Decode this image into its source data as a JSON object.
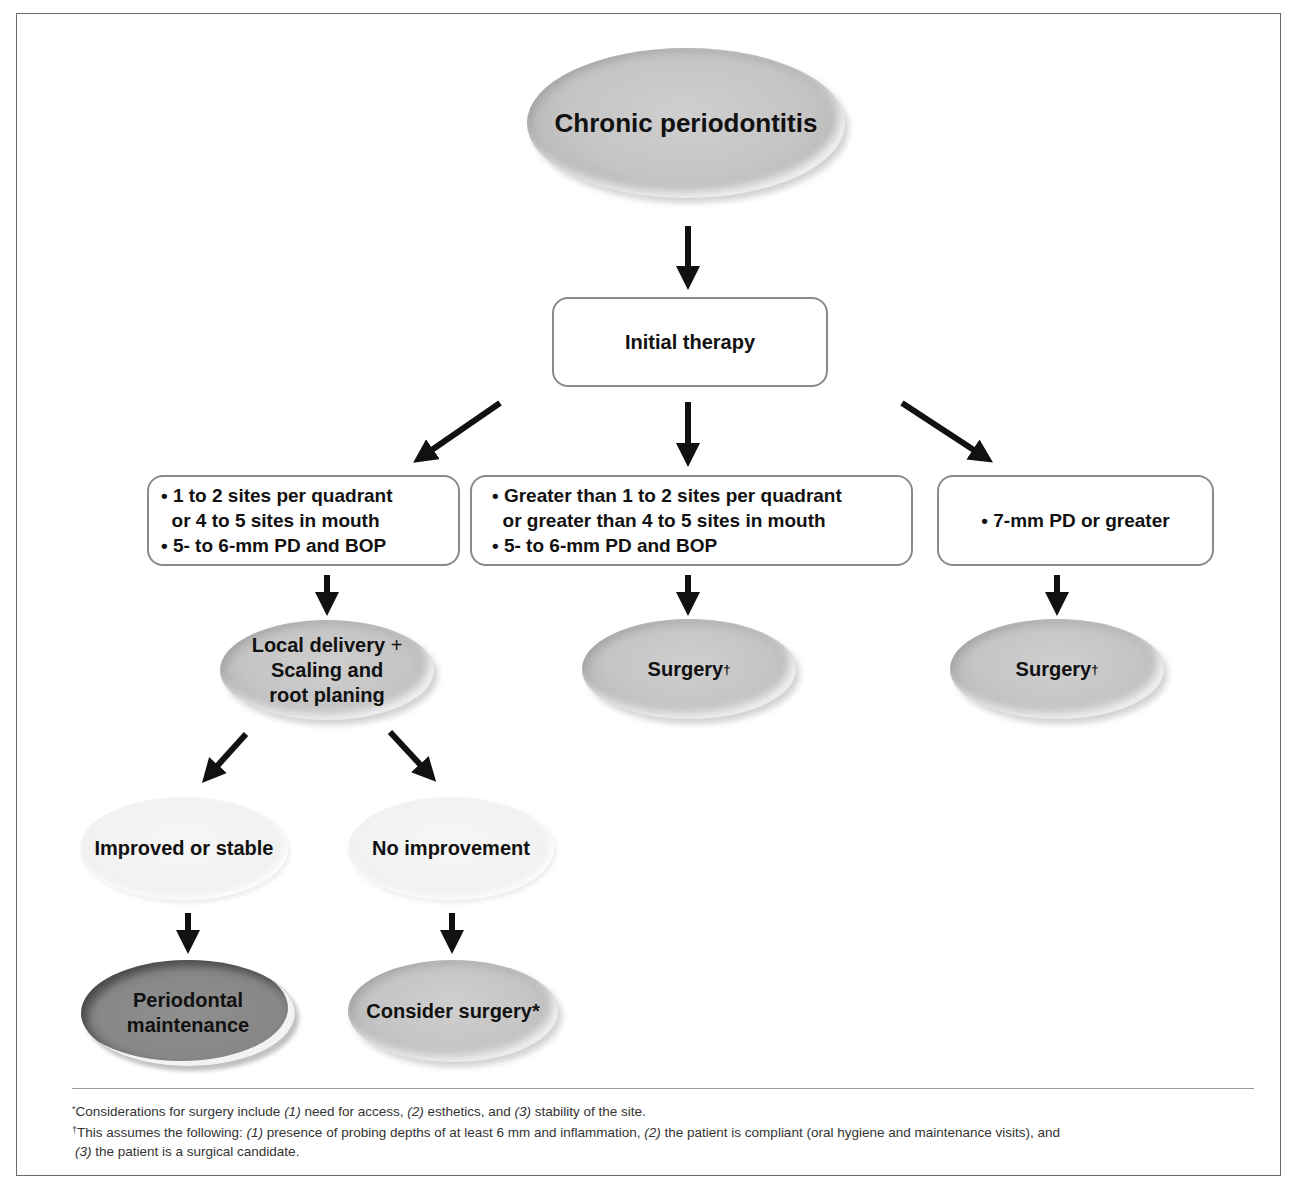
{
  "diagram": {
    "type": "flowchart",
    "title_node": "Chronic periodontitis",
    "nodes": {
      "root": {
        "label": "Chronic periodontitis",
        "shape": "ellipse",
        "fill": "gray"
      },
      "initial_therapy": {
        "label": "Initial therapy",
        "shape": "rounded-box"
      },
      "criteria_left": {
        "shape": "rounded-box",
        "lines": [
          "• 1 to 2 sites per quadrant",
          "  or 4 to 5 sites in mouth",
          "• 5- to 6-mm PD and BOP"
        ]
      },
      "criteria_middle": {
        "shape": "rounded-box",
        "lines": [
          "• Greater than 1 to 2 sites per quadrant",
          "  or greater than 4 to 5 sites in mouth",
          "• 5- to 6-mm PD and BOP"
        ]
      },
      "criteria_right": {
        "shape": "rounded-box",
        "lines": [
          "• 7-mm PD or greater"
        ]
      },
      "local_delivery": {
        "shape": "ellipse",
        "fill": "gray",
        "line1": "Local delivery",
        "plus": "+",
        "line2": "Scaling and",
        "line3": "root planing"
      },
      "surgery_middle": {
        "label": "Surgery",
        "marker": "†",
        "shape": "ellipse",
        "fill": "gray"
      },
      "surgery_right": {
        "label": "Surgery",
        "marker": "†",
        "shape": "ellipse",
        "fill": "gray"
      },
      "improved": {
        "label": "Improved or stable",
        "shape": "ellipse",
        "fill": "light"
      },
      "no_improvement": {
        "label": "No improvement",
        "shape": "ellipse",
        "fill": "light"
      },
      "maintenance": {
        "line1": "Periodontal",
        "line2": "maintenance",
        "shape": "ellipse",
        "fill": "dark"
      },
      "consider_surgery": {
        "label": "Consider surgery*",
        "shape": "ellipse",
        "fill": "gray"
      }
    },
    "edges": [
      [
        "root",
        "initial_therapy"
      ],
      [
        "initial_therapy",
        "criteria_left"
      ],
      [
        "initial_therapy",
        "criteria_middle"
      ],
      [
        "initial_therapy",
        "criteria_right"
      ],
      [
        "criteria_left",
        "local_delivery"
      ],
      [
        "criteria_middle",
        "surgery_middle"
      ],
      [
        "criteria_right",
        "surgery_right"
      ],
      [
        "local_delivery",
        "improved"
      ],
      [
        "local_delivery",
        "no_improvement"
      ],
      [
        "improved",
        "maintenance"
      ],
      [
        "no_improvement",
        "consider_surgery"
      ]
    ]
  },
  "footnotes": {
    "note1": {
      "marker": "*",
      "p1": "Considerations for surgery include ",
      "n1": "(1)",
      "p2": " need for access, ",
      "n2": "(2)",
      "p3": " esthetics, and ",
      "n3": "(3)",
      "p4": " stability of the site."
    },
    "note2": {
      "marker": "†",
      "p1": "This assumes the following: ",
      "n1": "(1)",
      "p2": " presence of probing depths of at least 6 mm and inflammation, ",
      "n2": "(2)",
      "p3": " the patient is compliant (oral hygiene and maintenance visits), and",
      "n3": "(3)",
      "p4": " the patient is a surgical candidate."
    }
  },
  "colors": {
    "arrow": "#111111",
    "box_border": "#8a8a8a",
    "frame_border": "#6a6a6a",
    "ellipse_gray": "#c4c4c4",
    "ellipse_light": "#f1f1f1",
    "ellipse_dark": "#878787"
  }
}
